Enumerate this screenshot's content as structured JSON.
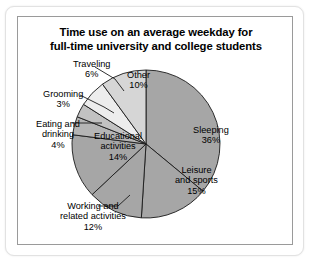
{
  "frame": {
    "outer_border_color": "#e2e2e2",
    "inner_border_color": "#9a9a9a",
    "background": "#ffffff"
  },
  "chart_data": {
    "type": "pie",
    "title": "Time use on an average weekday for full-time university and college students",
    "title_line1": "Time use on an average weekday for",
    "title_line2": "full-time university and college students",
    "xlabel": "",
    "ylabel": "",
    "units": "percent",
    "start_angle_deg": 0,
    "direction": "clockwise",
    "legend": "none",
    "grid": false,
    "total": 100,
    "categories": [
      "Sleeping",
      "Leisure and sports",
      "Working and related activities",
      "Educational activities",
      "Eating and drinking",
      "Grooming",
      "Traveling",
      "Other"
    ],
    "values": [
      36,
      15,
      12,
      14,
      4,
      3,
      6,
      10
    ],
    "slices": [
      {
        "name": "Sleeping",
        "value": 36,
        "label_line1": "Sleeping",
        "label_line2": "36%",
        "color": "#a6a6a6",
        "label_placement": "inside",
        "label_x": 175,
        "label_y": 108
      },
      {
        "name": "Leisure and sports",
        "value": 15,
        "label_line1": "Leisure",
        "label_line2": "and sports",
        "label_line3": "15%",
        "color": "#a6a6a6",
        "label_placement": "inside",
        "label_x": 157,
        "label_y": 148
      },
      {
        "name": "Working and related activities",
        "value": 12,
        "label_line1": "Working and",
        "label_line2": "related activities",
        "label_line3": "12%",
        "color": "#a6a6a6",
        "label_placement": "outside",
        "label_x": 42,
        "label_y": 184
      },
      {
        "name": "Educational activities",
        "value": 14,
        "label_line1": "Educational",
        "label_line2": "activities",
        "label_line3": "14%",
        "color": "#a6a6a6",
        "label_placement": "inside",
        "label_x": 76,
        "label_y": 114
      },
      {
        "name": "Eating and drinking",
        "value": 4,
        "label_line1": "Eating and",
        "label_line2": "drinking",
        "label_line3": "4%",
        "color": "#b5b5b5",
        "label_placement": "outside",
        "label_x": 18,
        "label_y": 102
      },
      {
        "name": "Grooming",
        "value": 3,
        "label_line1": "Grooming",
        "label_line2": "3%",
        "color": "#c2c2c2",
        "label_placement": "outside",
        "label_x": 25,
        "label_y": 72
      },
      {
        "name": "Traveling",
        "value": 6,
        "label_line1": "Traveling",
        "label_line2": "6%",
        "color": "#ededed",
        "label_placement": "outside",
        "label_x": 55,
        "label_y": 42
      },
      {
        "name": "Other",
        "value": 10,
        "label_line1": "Other",
        "label_line2": "10%",
        "color": "#d6d6d6",
        "label_placement": "inside",
        "label_x": 109,
        "label_y": 53
      }
    ],
    "geometry": {
      "center_x": 128,
      "center_y": 127,
      "radius": 74
    }
  }
}
